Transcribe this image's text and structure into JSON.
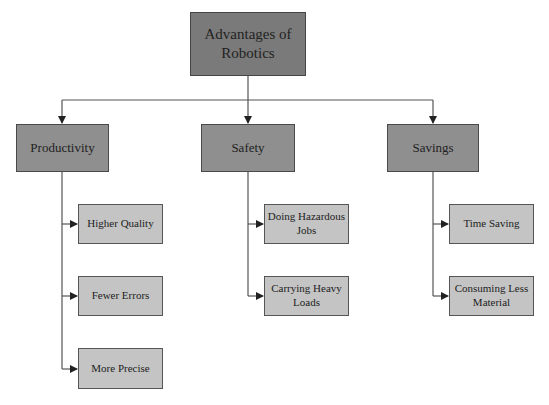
{
  "diagram": {
    "root": {
      "label": "Advantages of Robotics",
      "line1": "Advantages of",
      "line2": "Robotics"
    },
    "branches": [
      {
        "label": "Productivity",
        "children": [
          {
            "label": "Higher Quality"
          },
          {
            "label": "Fewer Errors"
          },
          {
            "label": "More Precise"
          }
        ]
      },
      {
        "label": "Safety",
        "children": [
          {
            "label": "Doing Hazardous Jobs",
            "line1": "Doing Hazardous",
            "line2": "Jobs"
          },
          {
            "label": "Carrying Heavy Loads",
            "line1": "Carrying Heavy",
            "line2": "Loads"
          }
        ]
      },
      {
        "label": "Savings",
        "children": [
          {
            "label": "Time Saving"
          },
          {
            "label": "Consuming Less Material",
            "line1": "Consuming Less",
            "line2": "Material"
          }
        ]
      }
    ],
    "colors": {
      "root_fill": "#7a7a7a",
      "branch_fill": "#8f8f8f",
      "leaf_fill": "#c4c4c4",
      "line": "#444444"
    }
  }
}
